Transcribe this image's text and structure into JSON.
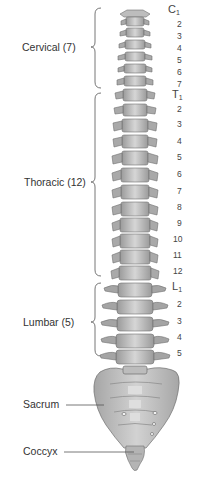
{
  "diagram": {
    "regions": [
      {
        "id": "cervical",
        "label": "Cervical (7)",
        "count": 7,
        "label_y": 47,
        "brace_top": 8,
        "brace_bottom": 88
      },
      {
        "id": "thoracic",
        "label": "Thoracic (12)",
        "count": 12,
        "label_y": 182,
        "brace_top": 93,
        "brace_bottom": 276
      },
      {
        "id": "lumbar",
        "label": "Lumbar (5)",
        "count": 5,
        "label_y": 322,
        "brace_top": 283,
        "brace_bottom": 356
      }
    ],
    "parts": [
      {
        "id": "sacrum",
        "label": "Sacrum",
        "label_y": 405
      },
      {
        "id": "coccyx",
        "label": "Coccyx",
        "label_y": 452
      }
    ],
    "vertebra_numbers": {
      "cervical": [
        {
          "text": "C",
          "sub": "1",
          "y": 10,
          "major": true
        },
        {
          "text": "2",
          "y": 25
        },
        {
          "text": "3",
          "y": 37
        },
        {
          "text": "4",
          "y": 49
        },
        {
          "text": "5",
          "y": 61
        },
        {
          "text": "6",
          "y": 73
        },
        {
          "text": "7",
          "y": 85
        }
      ],
      "thoracic": [
        {
          "text": "T",
          "sub": "1",
          "y": 95,
          "major": true
        },
        {
          "text": "2",
          "y": 110
        },
        {
          "text": "3",
          "y": 125
        },
        {
          "text": "4",
          "y": 142
        },
        {
          "text": "5",
          "y": 158
        },
        {
          "text": "6",
          "y": 175
        },
        {
          "text": "7",
          "y": 192
        },
        {
          "text": "8",
          "y": 208
        },
        {
          "text": "9",
          "y": 224
        },
        {
          "text": "10",
          "y": 240
        },
        {
          "text": "11",
          "y": 256
        },
        {
          "text": "12",
          "y": 272
        }
      ],
      "lumbar": [
        {
          "text": "L",
          "sub": "1",
          "y": 287,
          "major": true
        },
        {
          "text": "2",
          "y": 305
        },
        {
          "text": "3",
          "y": 322
        },
        {
          "text": "4",
          "y": 338
        },
        {
          "text": "5",
          "y": 354
        }
      ]
    },
    "colors": {
      "bone_fill": "#c9c9c9",
      "bone_dark": "#8a8a8a",
      "bone_light": "#e4e4e4",
      "bracket": "#666666",
      "text": "#333333"
    }
  }
}
